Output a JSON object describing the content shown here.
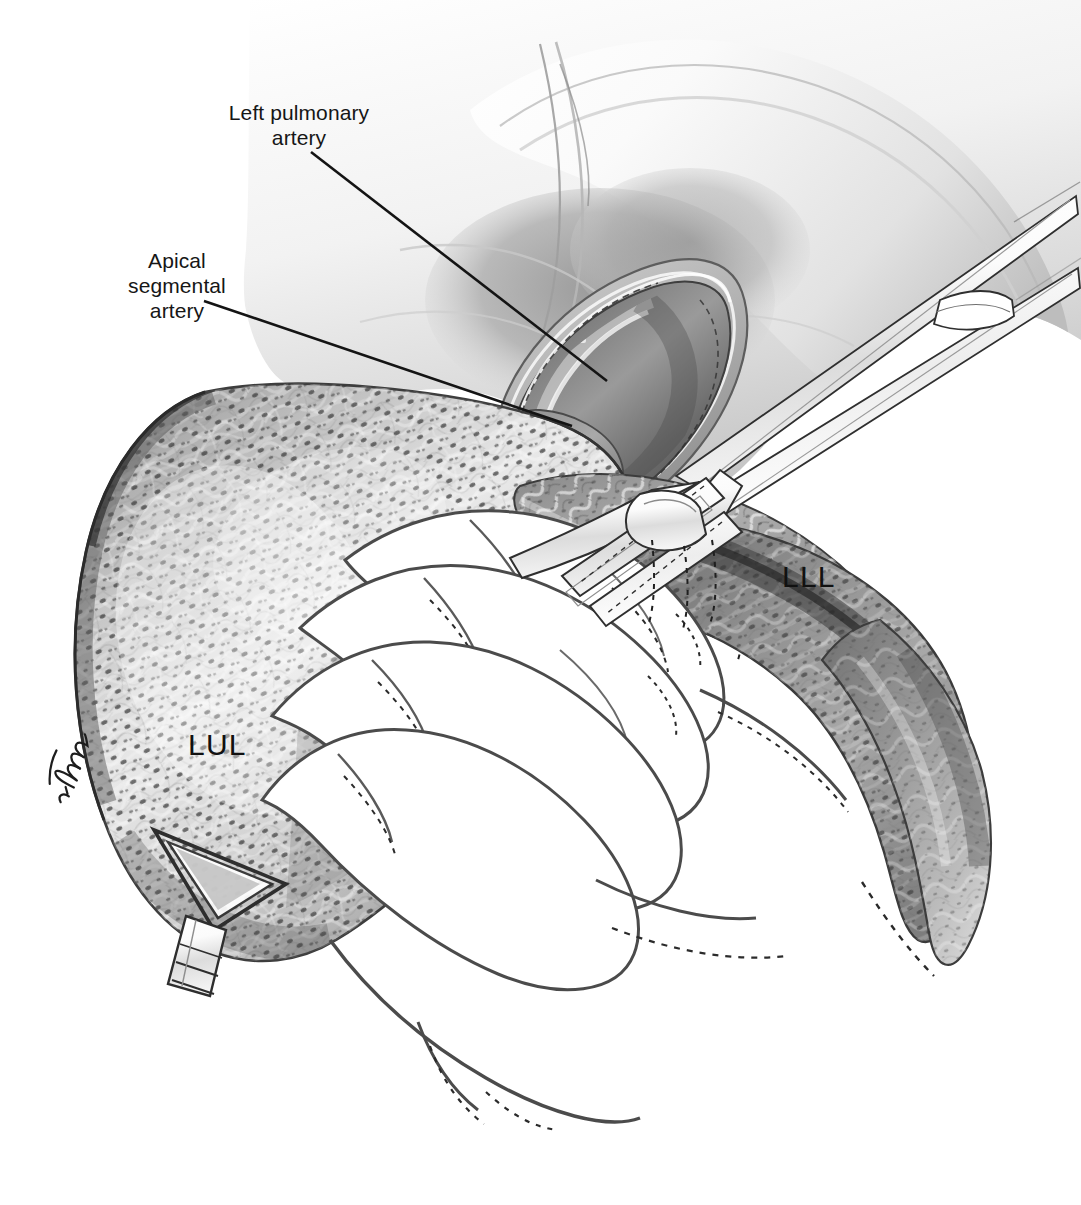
{
  "figure": {
    "kind": "surgical-anatomical-illustration",
    "width": 1081,
    "height": 1205,
    "background_color": "#ffffff",
    "ink_color": "#161616",
    "style": "grayscale pen-and-ink with halftone stipple shading"
  },
  "labels": {
    "left_pulmonary_artery": "Left pulmonary\nartery",
    "apical_segmental_artery": "Apical\nsegmental\nartery",
    "left_upper_lobe": "LUL",
    "left_lower_lobe": "LLL"
  },
  "leaders": [
    {
      "name": "leader-left-pulmonary-artery",
      "from_label": "left_pulmonary_artery",
      "x1": 311,
      "y1": 152,
      "x2": 607,
      "y2": 381
    },
    {
      "name": "leader-apical-segmental-artery",
      "from_label": "apical_segmental_artery",
      "x1": 204,
      "y1": 301,
      "x2": 572,
      "y2": 426
    }
  ],
  "structures": [
    {
      "name": "left-upper-lobe",
      "label": "LUL",
      "description": "left upper lobe, anthracotic stippled pleural surface, retracted anteriorly"
    },
    {
      "name": "left-lower-lobe",
      "label": "LLL",
      "description": "left lower lobe, darker wedge at right, retracted posteriorly"
    },
    {
      "name": "left-pulmonary-artery",
      "label": "Left pulmonary artery",
      "description": "main artery exposed within opened mediastinal pleural window"
    },
    {
      "name": "apical-segmental-artery",
      "label": "Apical segmental artery",
      "description": "first segmental branch arising anterolaterally"
    },
    {
      "name": "mediastinal-pleura-window",
      "description": "incised pleural envelope framing the artery"
    },
    {
      "name": "interlobar-fissure",
      "description": "fissure between LUL and LLL being developed"
    },
    {
      "name": "surgeons-hand",
      "description": "gloved hand, four fingers retracting the upper lobe inferiorly"
    },
    {
      "name": "dissecting-forceps",
      "description": "long fine-tipped dissecting forceps entering from upper right, jaws in the fissure"
    },
    {
      "name": "lung-retractor",
      "description": "triangular ring retractor on a shafted handle at lower left"
    },
    {
      "name": "chest-wall",
      "description": "soft-shaded chest wall / mediastinum filling the upper field"
    }
  ],
  "artist_signature": {
    "name": "artist-signature",
    "visible_text": "L. Thoms",
    "orientation": "rotated"
  }
}
